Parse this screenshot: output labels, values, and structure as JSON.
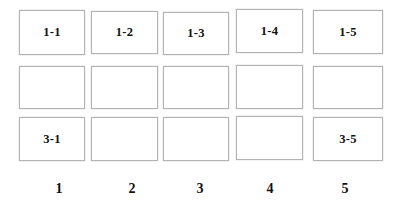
{
  "page": {
    "background_color": "#ffffff",
    "width": 395,
    "height": 209
  },
  "grid": {
    "rows": 3,
    "columns": 5,
    "cell_border_color": "#b3b3b3",
    "cell_background_color": "#ffffff",
    "text_color": "#111111",
    "cells": [
      {
        "id": "cell-r1c1",
        "row": 1,
        "column": 1,
        "label": "1-1",
        "x": 19,
        "y": 10,
        "width": 66,
        "height": 45
      },
      {
        "id": "cell-r1c2",
        "row": 1,
        "column": 2,
        "label": "1-2",
        "x": 91,
        "y": 11,
        "width": 67,
        "height": 43
      },
      {
        "id": "cell-r1c3",
        "row": 1,
        "column": 3,
        "label": "1-3",
        "x": 163,
        "y": 12,
        "width": 66,
        "height": 43
      },
      {
        "id": "cell-r1c4",
        "row": 1,
        "column": 4,
        "label": "1-4",
        "x": 236,
        "y": 9,
        "width": 67,
        "height": 44
      },
      {
        "id": "cell-r1c5",
        "row": 1,
        "column": 5,
        "label": "1-5",
        "x": 313,
        "y": 10,
        "width": 70,
        "height": 44
      },
      {
        "id": "cell-r2c1",
        "row": 2,
        "column": 1,
        "label": "",
        "x": 19,
        "y": 66,
        "width": 66,
        "height": 43
      },
      {
        "id": "cell-r2c2",
        "row": 2,
        "column": 2,
        "label": "",
        "x": 91,
        "y": 66,
        "width": 67,
        "height": 43
      },
      {
        "id": "cell-r2c3",
        "row": 2,
        "column": 3,
        "label": "",
        "x": 163,
        "y": 66,
        "width": 66,
        "height": 43
      },
      {
        "id": "cell-r2c4",
        "row": 2,
        "column": 4,
        "label": "",
        "x": 236,
        "y": 65,
        "width": 67,
        "height": 44
      },
      {
        "id": "cell-r2c5",
        "row": 2,
        "column": 5,
        "label": "",
        "x": 313,
        "y": 66,
        "width": 70,
        "height": 43
      },
      {
        "id": "cell-r3c1",
        "row": 3,
        "column": 1,
        "label": "3-1",
        "x": 19,
        "y": 117,
        "width": 66,
        "height": 44
      },
      {
        "id": "cell-r3c2",
        "row": 3,
        "column": 2,
        "label": "",
        "x": 91,
        "y": 117,
        "width": 67,
        "height": 44
      },
      {
        "id": "cell-r3c3",
        "row": 3,
        "column": 3,
        "label": "",
        "x": 163,
        "y": 117,
        "width": 66,
        "height": 44
      },
      {
        "id": "cell-r3c4",
        "row": 3,
        "column": 4,
        "label": "",
        "x": 236,
        "y": 116,
        "width": 67,
        "height": 44
      },
      {
        "id": "cell-r3c5",
        "row": 3,
        "column": 5,
        "label": "3-5",
        "x": 313,
        "y": 117,
        "width": 70,
        "height": 44
      }
    ]
  },
  "column_labels": [
    {
      "id": "column-label-1",
      "label": "1",
      "center_x": 59,
      "y": 187
    },
    {
      "id": "column-label-2",
      "label": "2",
      "center_x": 132,
      "y": 187
    },
    {
      "id": "column-label-3",
      "label": "3",
      "center_x": 200,
      "y": 187
    },
    {
      "id": "column-label-4",
      "label": "4",
      "center_x": 270,
      "y": 187
    },
    {
      "id": "column-label-5",
      "label": "5",
      "center_x": 345,
      "y": 187
    }
  ]
}
